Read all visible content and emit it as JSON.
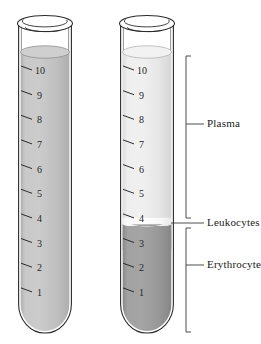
{
  "figure": {
    "background_color": "#ffffff",
    "outline_color": "#2b2b2b"
  },
  "tubes": [
    {
      "id": "tube-unseparated",
      "name": "whole-blood-tube",
      "x": 18,
      "y_rim": 22,
      "width": 54,
      "graduations": [
        "10",
        "9",
        "8",
        "7",
        "6",
        "5",
        "4",
        "3",
        "2",
        "1"
      ],
      "layers": [
        {
          "name": "whole-blood",
          "label": "",
          "color": "#c4c4c4",
          "from_mark": 0,
          "to_mark": 10.6
        }
      ]
    },
    {
      "id": "tube-separated",
      "name": "centrifuged-blood-tube",
      "x": 120,
      "y_rim": 22,
      "width": 54,
      "graduations": [
        "10",
        "9",
        "8",
        "7",
        "6",
        "5",
        "4",
        "3",
        "2",
        "1"
      ],
      "layers": [
        {
          "name": "plasma",
          "label": "Plasma",
          "color": "#e9e9e9",
          "from_mark": 4.05,
          "to_mark": 10.6
        },
        {
          "name": "leukocytes",
          "label": "Leukocytes",
          "color": "#fbfbfb",
          "from_mark": 3.82,
          "to_mark": 4.05
        },
        {
          "name": "erythrocytes",
          "label": "Erythrocytes",
          "color": "#9b9b9b",
          "from_mark": 0,
          "to_mark": 3.82
        }
      ]
    }
  ],
  "annotations": [
    {
      "name": "plasma-annotation",
      "text": "Plasma",
      "style": "bracket",
      "x": 208,
      "y": 122
    },
    {
      "name": "leukocytes-annotation",
      "text": "Leukocytes",
      "style": "leader",
      "x": 208,
      "y": 225
    },
    {
      "name": "erythrocytes-annotation",
      "text": "Erythrocytes",
      "style": "bracket",
      "x": 208,
      "y": 264
    }
  ],
  "scale": {
    "marks": [
      1,
      2,
      3,
      4,
      5,
      6,
      7,
      8,
      9,
      10
    ],
    "unit": "mL",
    "top_mark_y": 70.0,
    "spacing_px": 24.65
  }
}
